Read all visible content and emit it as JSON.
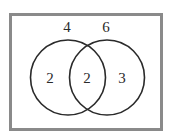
{
  "diagram": {
    "type": "venn",
    "sets": [
      {
        "name": "left-set",
        "total_label": "4",
        "only_count": "2"
      },
      {
        "name": "right-set",
        "total_label": "6",
        "only_count": "3"
      }
    ],
    "intersection_count": "2",
    "colors": {
      "border": "#8a8a8a",
      "circle_stroke": "#2a2a2a",
      "text": "#2a2a2a",
      "background": "#ffffff"
    }
  }
}
